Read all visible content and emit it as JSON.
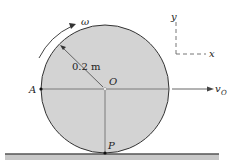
{
  "diagram": {
    "wheel": {
      "fill": "#d3d3d3",
      "stroke": "#333333"
    },
    "labels": {
      "omega": "ω",
      "radius": "0.2 m",
      "center": "O",
      "point_a": "A",
      "point_p": "P",
      "velocity": "v",
      "velocity_sub": "O",
      "axis_y": "y",
      "axis_x": "x"
    }
  }
}
